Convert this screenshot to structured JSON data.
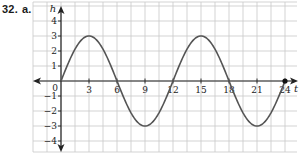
{
  "problem": {
    "number": "32.",
    "part": "a."
  },
  "chart_data": {
    "type": "line",
    "title": "",
    "xlabel": "t",
    "ylabel": "h",
    "x_ticks": [
      "3",
      "6",
      "9",
      "12",
      "15",
      "18",
      "21",
      "24"
    ],
    "y_ticks": [
      "4",
      "3",
      "2",
      "1",
      "-1",
      "-2",
      "-3",
      "-4"
    ],
    "origin_label": "0",
    "xlim": [
      -3,
      25.5
    ],
    "ylim": [
      -5,
      5
    ],
    "grid": true,
    "grid_step_x": 1.5,
    "grid_step_y": 1,
    "equation": "h = 3 sin(pi t / 6)",
    "series": [
      {
        "name": "h(t)",
        "x": [
          0,
          1.5,
          3,
          4.5,
          6,
          7.5,
          9,
          10.5,
          12,
          13.5,
          15,
          16.5,
          18,
          19.5,
          21,
          22.5,
          24
        ],
        "values": [
          0,
          2.12,
          3,
          2.12,
          0,
          -2.12,
          -3,
          -2.12,
          0,
          2.12,
          3,
          2.12,
          0,
          -2.12,
          -3,
          -2.12,
          0
        ]
      }
    ],
    "annotations": [
      {
        "type": "endpoint-dot",
        "x": 24,
        "y": 0
      }
    ]
  },
  "colors": {
    "curve": "#555555",
    "grid": "#c8c8c8",
    "axis": "#222222"
  }
}
